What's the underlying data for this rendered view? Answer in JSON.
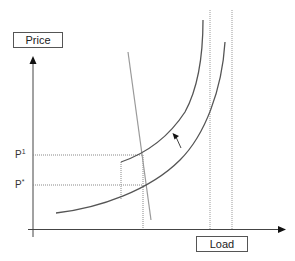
{
  "diagram": {
    "y_axis_label": "Price",
    "x_axis_label": "Load",
    "price_levels": [
      {
        "name": "p1",
        "base": "P",
        "sup": "1"
      },
      {
        "name": "pstar",
        "base": "P",
        "sup": "*"
      }
    ],
    "elements": [
      "supply-curve-lower",
      "supply-curve-upper",
      "demand-line",
      "shift-arrow",
      "capacity-line-1",
      "capacity-line-2"
    ],
    "colors": {
      "curve": "#555555",
      "demand": "#9a9a9a",
      "axis": "#444444",
      "dotted": "#888888"
    }
  }
}
